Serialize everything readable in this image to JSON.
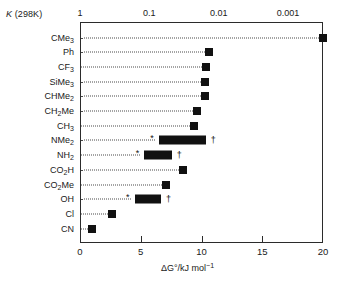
{
  "chart_data": {
    "type": "bar",
    "title": "",
    "xlabel": "ΔG°/kJ mol⁻¹",
    "ylabel": "",
    "xlim": [
      0,
      20
    ],
    "grid": false,
    "legend": "none",
    "orientation": "horizontal",
    "categories": [
      "CMe3",
      "Ph",
      "CF3",
      "SiMe3",
      "CHMe2",
      "CH2Me",
      "CH3",
      "NMe2",
      "NH2",
      "CO2H",
      "CO2Me",
      "OH",
      "Cl",
      "CN"
    ],
    "values": [
      20.0,
      10.6,
      10.4,
      10.3,
      10.3,
      9.6,
      9.4,
      8.9,
      6.5,
      8.5,
      7.1,
      5.6,
      2.6,
      1.0
    ],
    "ranges": [
      null,
      null,
      null,
      null,
      null,
      null,
      null,
      [
        6.5,
        10.4
      ],
      [
        5.3,
        7.6
      ],
      null,
      null,
      [
        4.5,
        6.7
      ],
      null,
      null
    ],
    "secondary_axis": {
      "label": "K (298K)",
      "scale": "log",
      "ticks": [
        "1",
        "0.1",
        "0.01",
        "0.001"
      ],
      "tick_values": [
        1,
        0.1,
        0.01,
        0.001
      ],
      "tick_positions_dG": [
        0,
        5.708,
        11.416,
        17.124
      ]
    },
    "x_ticks": [
      0,
      5,
      10,
      15,
      20
    ],
    "annotations": [
      {
        "category": "NMe2",
        "symbol": "*",
        "position": "left"
      },
      {
        "category": "NMe2",
        "symbol": "†",
        "position": "right"
      },
      {
        "category": "NH2",
        "symbol": "*",
        "position": "left"
      },
      {
        "category": "NH2",
        "symbol": "†",
        "position": "right"
      },
      {
        "category": "OH",
        "symbol": "*",
        "position": "left"
      },
      {
        "category": "OH",
        "symbol": "†",
        "position": "right"
      }
    ]
  },
  "axes": {
    "k_header": "K (298K)",
    "k_header_italic": "K",
    "k_header_rest": " (298K)",
    "k_ticks": [
      "1",
      "0.1",
      "0.01",
      "0.001"
    ],
    "x_ticks": [
      "0",
      "5",
      "10",
      "15",
      "20"
    ],
    "x_title_delta": "ΔG°/kJ mol",
    "x_title_sup": "−1"
  },
  "rows": [
    {
      "key": "CMe3",
      "base": "CMe",
      "sub": "3",
      "suffix": ""
    },
    {
      "key": "Ph",
      "base": "Ph",
      "sub": "",
      "suffix": ""
    },
    {
      "key": "CF3",
      "base": "CF",
      "sub": "3",
      "suffix": ""
    },
    {
      "key": "SiMe3",
      "base": "SiMe",
      "sub": "3",
      "suffix": ""
    },
    {
      "key": "CHMe2",
      "base": "CHMe",
      "sub": "2",
      "suffix": ""
    },
    {
      "key": "CH2Me",
      "base": "CH",
      "sub": "2",
      "suffix": "Me"
    },
    {
      "key": "CH3",
      "base": "CH",
      "sub": "3",
      "suffix": ""
    },
    {
      "key": "NMe2",
      "base": "NMe",
      "sub": "2",
      "suffix": ""
    },
    {
      "key": "NH2",
      "base": "NH",
      "sub": "2",
      "suffix": ""
    },
    {
      "key": "CO2H",
      "base": "CO",
      "sub": "2",
      "suffix": "H"
    },
    {
      "key": "CO2Me",
      "base": "CO",
      "sub": "2",
      "suffix": "Me"
    },
    {
      "key": "OH",
      "base": "OH",
      "sub": "",
      "suffix": ""
    },
    {
      "key": "Cl",
      "base": "Cl",
      "sub": "",
      "suffix": ""
    },
    {
      "key": "CN",
      "base": "CN",
      "sub": "",
      "suffix": ""
    }
  ],
  "colors": {
    "marker": "#111111",
    "frame": "#2b2b2b",
    "leader": "#4a4a4a",
    "background": "#ffffff"
  }
}
